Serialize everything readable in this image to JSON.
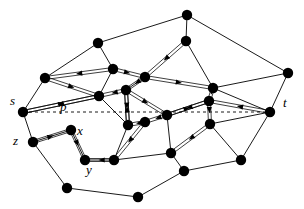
{
  "figure": {
    "kind": "planar-graph-diagram",
    "background_color": "#ffffff",
    "ink_color": "#000000",
    "width": 304,
    "height": 209
  },
  "labels": [
    {
      "id": "s",
      "text": "s",
      "x": 10,
      "y": 94,
      "italic": true
    },
    {
      "id": "p",
      "text": "p",
      "x": 60,
      "y": 100,
      "italic": true
    },
    {
      "id": "z",
      "text": "z",
      "x": 13,
      "y": 134,
      "italic": true
    },
    {
      "id": "x",
      "text": "x",
      "x": 77,
      "y": 124,
      "italic": true
    },
    {
      "id": "y",
      "text": "y",
      "x": 86,
      "y": 163,
      "italic": true
    },
    {
      "id": "t",
      "text": "t",
      "x": 283,
      "y": 96,
      "italic": true
    }
  ],
  "path": {
    "name": "p",
    "style": "dashed",
    "from_label": "s",
    "to_label": "t",
    "x1": 23,
    "y1": 112,
    "x2": 270,
    "y2": 112,
    "dash": "3,3",
    "color": "#000000"
  },
  "nodes": [
    {
      "id": "n0",
      "x": 187,
      "y": 15,
      "r": 5.2,
      "label": null
    },
    {
      "id": "n1",
      "x": 98,
      "y": 43,
      "r": 5.2,
      "label": null
    },
    {
      "id": "n2",
      "x": 186,
      "y": 41,
      "r": 5.2,
      "label": null
    },
    {
      "id": "n3",
      "x": 45,
      "y": 78,
      "r": 5.2,
      "label": null
    },
    {
      "id": "n4",
      "x": 113,
      "y": 69,
      "r": 5.2,
      "label": null
    },
    {
      "id": "n5",
      "x": 145,
      "y": 77,
      "r": 5.2,
      "label": null
    },
    {
      "id": "n6",
      "x": 288,
      "y": 73,
      "r": 5.2,
      "label": null
    },
    {
      "id": "n7",
      "x": 99,
      "y": 96,
      "r": 5.2,
      "label": null
    },
    {
      "id": "n8",
      "x": 126,
      "y": 90,
      "r": 5.2,
      "label": null
    },
    {
      "id": "n9",
      "x": 213,
      "y": 88,
      "r": 5.2,
      "label": null
    },
    {
      "id": "n10",
      "x": 209,
      "y": 101,
      "r": 5.2,
      "label": null
    },
    {
      "id": "n11",
      "x": 23,
      "y": 112,
      "r": 5.2,
      "label": "s"
    },
    {
      "id": "n12",
      "x": 270,
      "y": 112,
      "r": 5.2,
      "label": "t"
    },
    {
      "id": "n13",
      "x": 128,
      "y": 125,
      "r": 5.2,
      "label": null
    },
    {
      "id": "n14",
      "x": 145,
      "y": 122,
      "r": 5.2,
      "label": null
    },
    {
      "id": "n15",
      "x": 167,
      "y": 115,
      "r": 5.2,
      "label": null
    },
    {
      "id": "n16",
      "x": 33,
      "y": 142,
      "r": 5.2,
      "label": "z"
    },
    {
      "id": "n17",
      "x": 71,
      "y": 130,
      "r": 5.2,
      "label": "x"
    },
    {
      "id": "n18",
      "x": 210,
      "y": 124,
      "r": 5.2,
      "label": null
    },
    {
      "id": "n19",
      "x": 85,
      "y": 160,
      "r": 5.2,
      "label": "y"
    },
    {
      "id": "n20",
      "x": 114,
      "y": 160,
      "r": 5.2,
      "label": null
    },
    {
      "id": "n21",
      "x": 171,
      "y": 153,
      "r": 5.2,
      "label": null
    },
    {
      "id": "n22",
      "x": 241,
      "y": 160,
      "r": 5.2,
      "label": null
    },
    {
      "id": "n23",
      "x": 67,
      "y": 188,
      "r": 5.2,
      "label": null
    },
    {
      "id": "n24",
      "x": 184,
      "y": 171,
      "r": 5.2,
      "label": null
    },
    {
      "id": "n25",
      "x": 138,
      "y": 197,
      "r": 5.2,
      "label": null
    }
  ],
  "plain_edges": [
    {
      "from": "n1",
      "to": "n0"
    },
    {
      "from": "n1",
      "to": "n3"
    },
    {
      "from": "n1",
      "to": "n4"
    },
    {
      "from": "n0",
      "to": "n2"
    },
    {
      "from": "n0",
      "to": "n6"
    },
    {
      "from": "n2",
      "to": "n9"
    },
    {
      "from": "n6",
      "to": "n9"
    },
    {
      "from": "n6",
      "to": "n12"
    },
    {
      "from": "n3",
      "to": "n11"
    },
    {
      "from": "n4",
      "to": "n7"
    },
    {
      "from": "n11",
      "to": "n16"
    },
    {
      "from": "n16",
      "to": "n17"
    },
    {
      "from": "n16",
      "to": "n23"
    },
    {
      "from": "n17",
      "to": "n19"
    },
    {
      "from": "n19",
      "to": "n20"
    },
    {
      "from": "n20",
      "to": "n21"
    },
    {
      "from": "n23",
      "to": "n25"
    },
    {
      "from": "n25",
      "to": "n24"
    },
    {
      "from": "n24",
      "to": "n22"
    },
    {
      "from": "n22",
      "to": "n12"
    },
    {
      "from": "n21",
      "to": "n24"
    },
    {
      "from": "n15",
      "to": "n21"
    },
    {
      "from": "n18",
      "to": "n22"
    },
    {
      "from": "n12",
      "to": "n18"
    },
    {
      "from": "n9",
      "to": "n12"
    },
    {
      "from": "n5",
      "to": "n8"
    },
    {
      "from": "n13",
      "to": "n20"
    },
    {
      "from": "n7",
      "to": "n13"
    }
  ],
  "directed_edges": [
    {
      "from": "n4",
      "to": "n3",
      "note": "arrow toward left node"
    },
    {
      "from": "n3",
      "to": "n7",
      "note": "arrow toward n7"
    },
    {
      "from": "n4",
      "to": "n5",
      "note": "arrow right"
    },
    {
      "from": "n5",
      "to": "n8",
      "note": "arrow down-left"
    },
    {
      "from": "n8",
      "to": "n7",
      "note": "arrow left"
    },
    {
      "from": "n7",
      "to": "n11",
      "note": "arrow toward s"
    },
    {
      "from": "n2",
      "to": "n5",
      "note": "arrow up"
    },
    {
      "from": "n5",
      "to": "n9",
      "note": "arrow right-down"
    },
    {
      "from": "n9",
      "to": "n10",
      "note": "arrow down"
    },
    {
      "from": "n10",
      "to": "n15",
      "note": "arrow left"
    },
    {
      "from": "n15",
      "to": "n14",
      "note": "arrow left"
    },
    {
      "from": "n14",
      "to": "n13",
      "note": "arrow left"
    },
    {
      "from": "n13",
      "to": "n8",
      "note": "arrow up"
    },
    {
      "from": "n8",
      "to": "n15",
      "note": "arrow right"
    },
    {
      "from": "n15",
      "to": "n10",
      "note": "arrow right"
    },
    {
      "from": "n10",
      "to": "n18",
      "note": "arrow down"
    },
    {
      "from": "n18",
      "to": "n21",
      "note": "arrow down-left"
    },
    {
      "from": "n12",
      "to": "n10",
      "note": "arrow left toward center"
    },
    {
      "from": "n16",
      "to": "n17",
      "note": "arrow left toward z"
    },
    {
      "from": "n17",
      "to": "n19",
      "note": "arrow down"
    },
    {
      "from": "n20",
      "to": "n19",
      "note": "arrow left"
    },
    {
      "from": "n14",
      "to": "n20",
      "note": "arrow down-left"
    },
    {
      "from": "n11",
      "to": "n7",
      "note": "double line from s"
    },
    {
      "from": "n8",
      "to": "n13",
      "note": "inner double link"
    }
  ]
}
